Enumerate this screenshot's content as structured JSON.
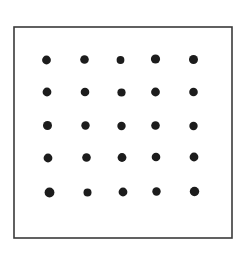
{
  "figure": {
    "type": "dot-grid",
    "background_color": "#ffffff",
    "canvas": {
      "width": 251,
      "height": 255
    }
  },
  "border": {
    "name": "rectangle-outline",
    "x": 14.0,
    "y": 27.0,
    "width": 218.0,
    "height": 211.0,
    "stroke_color": "#3a3a3a",
    "stroke_width": 1.6,
    "fill_color": "#ffffff"
  },
  "grid": {
    "rows": 5,
    "columns": 5,
    "total_dots": 25,
    "dot_color": "#1c1c1c",
    "column_centers_x": [
      47.5,
      85.5,
      121.5,
      156.0,
      193.0
    ],
    "row_centers_y": [
      60.0,
      92.0,
      125.5,
      157.5,
      192.0
    ],
    "mean_column_spacing_x": 36.4,
    "mean_row_spacing_y": 33.0,
    "mean_dot_radius": 4.3
  },
  "dots": [
    {
      "id": "dot-r1c1",
      "row": 1,
      "col": 1,
      "cx": 46.5,
      "cy": 60.0,
      "r": 4.4
    },
    {
      "id": "dot-r1c2",
      "row": 1,
      "col": 2,
      "cx": 84.5,
      "cy": 59.5,
      "r": 4.3
    },
    {
      "id": "dot-r1c3",
      "row": 1,
      "col": 3,
      "cx": 120.5,
      "cy": 60.0,
      "r": 3.9
    },
    {
      "id": "dot-r1c4",
      "row": 1,
      "col": 4,
      "cx": 155.5,
      "cy": 59.0,
      "r": 4.6
    },
    {
      "id": "dot-r1c5",
      "row": 1,
      "col": 5,
      "cx": 193.5,
      "cy": 59.5,
      "r": 4.5
    },
    {
      "id": "dot-r2c1",
      "row": 2,
      "col": 1,
      "cx": 47.0,
      "cy": 92.0,
      "r": 4.4
    },
    {
      "id": "dot-r2c2",
      "row": 2,
      "col": 2,
      "cx": 85.0,
      "cy": 92.0,
      "r": 4.3
    },
    {
      "id": "dot-r2c3",
      "row": 2,
      "col": 3,
      "cx": 121.5,
      "cy": 92.5,
      "r": 4.1
    },
    {
      "id": "dot-r2c4",
      "row": 2,
      "col": 4,
      "cx": 155.5,
      "cy": 92.0,
      "r": 4.4
    },
    {
      "id": "dot-r2c5",
      "row": 2,
      "col": 5,
      "cx": 193.5,
      "cy": 92.0,
      "r": 4.3
    },
    {
      "id": "dot-r3c1",
      "row": 3,
      "col": 1,
      "cx": 47.5,
      "cy": 125.5,
      "r": 4.5
    },
    {
      "id": "dot-r3c2",
      "row": 3,
      "col": 2,
      "cx": 85.5,
      "cy": 125.5,
      "r": 4.2
    },
    {
      "id": "dot-r3c3",
      "row": 3,
      "col": 3,
      "cx": 121.5,
      "cy": 126.0,
      "r": 4.2
    },
    {
      "id": "dot-r3c4",
      "row": 3,
      "col": 4,
      "cx": 155.5,
      "cy": 125.5,
      "r": 4.3
    },
    {
      "id": "dot-r3c5",
      "row": 3,
      "col": 5,
      "cx": 193.5,
      "cy": 126.0,
      "r": 4.2
    },
    {
      "id": "dot-r4c1",
      "row": 4,
      "col": 1,
      "cx": 48.0,
      "cy": 158.0,
      "r": 4.4
    },
    {
      "id": "dot-r4c2",
      "row": 4,
      "col": 2,
      "cx": 86.5,
      "cy": 157.5,
      "r": 4.3
    },
    {
      "id": "dot-r4c3",
      "row": 4,
      "col": 3,
      "cx": 122.0,
      "cy": 157.5,
      "r": 4.4
    },
    {
      "id": "dot-r4c4",
      "row": 4,
      "col": 4,
      "cx": 156.0,
      "cy": 157.0,
      "r": 4.3
    },
    {
      "id": "dot-r4c5",
      "row": 4,
      "col": 5,
      "cx": 194.0,
      "cy": 157.0,
      "r": 4.4
    },
    {
      "id": "dot-r5c1",
      "row": 5,
      "col": 1,
      "cx": 49.5,
      "cy": 192.5,
      "r": 4.9
    },
    {
      "id": "dot-r5c2",
      "row": 5,
      "col": 2,
      "cx": 87.5,
      "cy": 192.5,
      "r": 4.0
    },
    {
      "id": "dot-r5c3",
      "row": 5,
      "col": 3,
      "cx": 123.0,
      "cy": 192.0,
      "r": 4.4
    },
    {
      "id": "dot-r5c4",
      "row": 5,
      "col": 4,
      "cx": 156.5,
      "cy": 191.5,
      "r": 4.2
    },
    {
      "id": "dot-r5c5",
      "row": 5,
      "col": 5,
      "cx": 194.5,
      "cy": 191.5,
      "r": 4.7
    }
  ]
}
